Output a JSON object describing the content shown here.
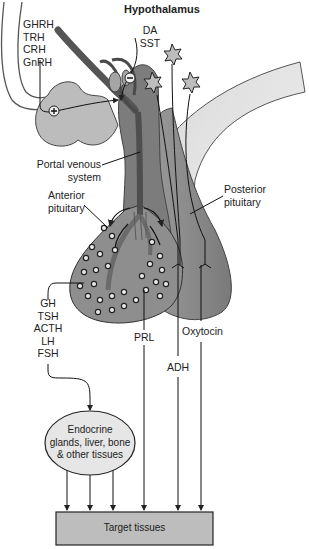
{
  "title": "Hypothalamus",
  "hypothalamic_releasing_hormones": [
    "GHRH",
    "TRH",
    "CRH",
    "GnRH"
  ],
  "hypothalamic_inhibitory_hormones": [
    "DA",
    "SST"
  ],
  "signs": {
    "stimulatory": "+",
    "inhibitory": "−"
  },
  "labels": {
    "portal_line1": "Portal venous",
    "portal_line2": "system",
    "anterior_line1": "Anterior",
    "anterior_line2": "pituitary",
    "posterior_line1": "Posterior",
    "posterior_line2": "pituitary"
  },
  "anterior_hormones": [
    "GH",
    "TSH",
    "ACTH",
    "LH",
    "FSH"
  ],
  "other_hormones": {
    "prl": "PRL",
    "adh": "ADH",
    "oxytocin": "Oxytocin"
  },
  "endocrine_node": {
    "line1": "Endocrine",
    "line2": "glands, liver, bone",
    "line3": "& other tissues"
  },
  "target_node": "Target tissues",
  "colors": {
    "dark_stalk": "#5f5f5f",
    "medium_gland": "#8a8a8a",
    "light_tissue": "#c4c4c4",
    "ellipse_fill": "#e6e6e6",
    "box_fill": "#bdbdbd",
    "line": "#222222"
  }
}
